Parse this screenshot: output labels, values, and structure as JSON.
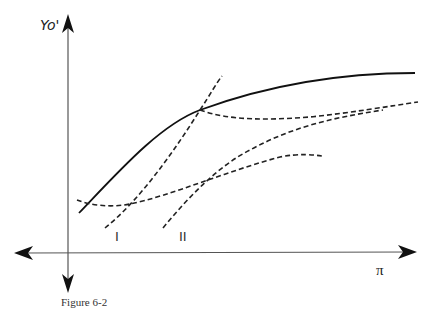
{
  "figure": {
    "caption": "Figure 6-2",
    "top_fragment": "…"
  },
  "axes": {
    "y_label": "Yo'",
    "x_label": "π"
  },
  "curves": {
    "labels": [
      "I",
      "II"
    ],
    "solid": {
      "name": "envelope",
      "style": "solid"
    },
    "dashed": [
      {
        "name": "I",
        "style": "dashed"
      },
      {
        "name": "II",
        "style": "dashed"
      },
      {
        "name": "low-flat",
        "style": "dashed"
      },
      {
        "name": "upper-flat",
        "style": "dashed"
      }
    ]
  },
  "colors": {
    "ink": "#222222",
    "axis": "#555555",
    "background": "#ffffff"
  }
}
